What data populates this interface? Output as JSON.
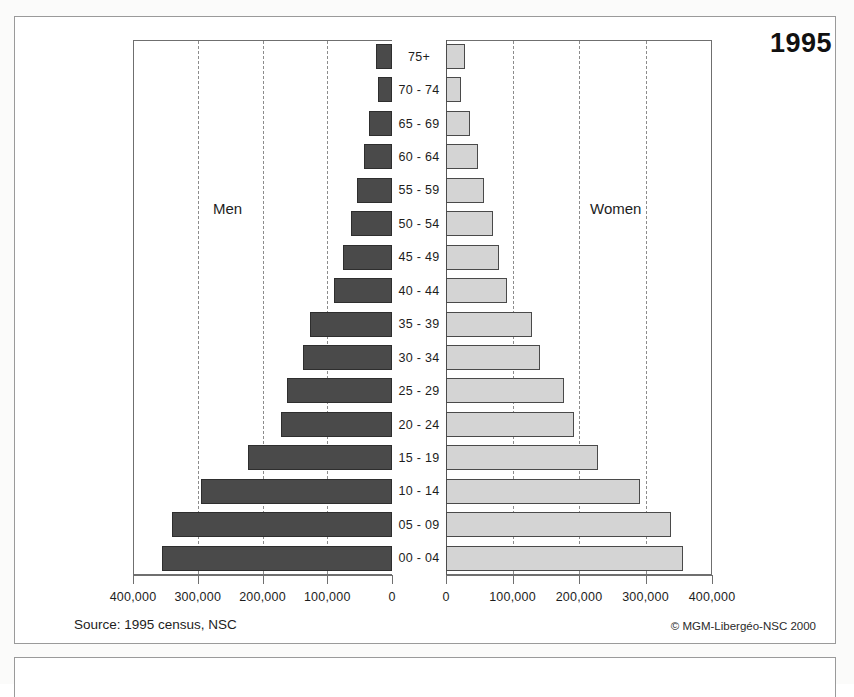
{
  "title": "1995",
  "source_note": "Source: 1995 census, NSC",
  "credit_note": "© MGM-Libergéo-NSC 2000",
  "captions": {
    "men": "Men",
    "women": "Women"
  },
  "axis": {
    "left_labels": [
      "400,000",
      "300,000",
      "200,000",
      "100,000",
      "0"
    ],
    "right_labels": [
      "0",
      "100,000",
      "200,000",
      "300,000",
      "400,000"
    ],
    "max": 400000,
    "tick_step": 100000
  },
  "colors": {
    "men_bar": "#4a4a4a",
    "women_bar": "#d4d4d4",
    "bar_outline": "#2e2e2e",
    "gridline": "#8c8c8c",
    "frame": "#6f6f6f",
    "background": "#ffffff"
  },
  "chart_data": {
    "type": "bar",
    "subtype": "population-pyramid",
    "title": "1995",
    "xlabel": "",
    "ylabel": "",
    "xlim": [
      0,
      400000
    ],
    "grid": true,
    "legend_position": "inside-plot",
    "categories": [
      "75+",
      "70 - 74",
      "65 - 69",
      "60 - 64",
      "55 - 59",
      "50 - 54",
      "45 - 49",
      "40 - 44",
      "35 - 39",
      "30 - 34",
      "25 - 29",
      "20 - 24",
      "15 - 19",
      "10 - 14",
      "05 - 09",
      "00 - 04"
    ],
    "series": [
      {
        "name": "Men",
        "values": [
          25000,
          21000,
          35000,
          44000,
          54000,
          63000,
          76000,
          90000,
          127000,
          138000,
          162000,
          172000,
          222000,
          295000,
          340000,
          355000
        ]
      },
      {
        "name": "Women",
        "values": [
          28000,
          22000,
          36000,
          48000,
          57000,
          70000,
          79000,
          91000,
          130000,
          142000,
          178000,
          192000,
          229000,
          292000,
          338000,
          357000
        ]
      }
    ]
  }
}
